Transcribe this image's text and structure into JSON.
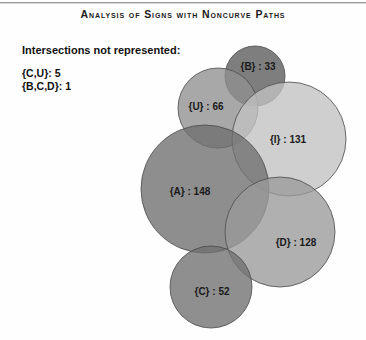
{
  "title": "Analysis of Signs with Noncurve Paths",
  "legend": {
    "heading": "Intersections not represented:",
    "rows": [
      "{C,U}: 5",
      "{B,C,D}: 1"
    ]
  },
  "chart_data": {
    "type": "venn",
    "title": "Analysis of Signs with Noncurve Paths",
    "xlabel": "",
    "ylabel": "",
    "legend_position": "top-left",
    "grid": false,
    "sets": [
      {
        "name": "B",
        "label": "{B} : 33",
        "value": 33,
        "cx": 255,
        "cy": 76,
        "r": 30,
        "color": "#5a5a5a"
      },
      {
        "name": "U",
        "label": "{U} : 66",
        "value": 66,
        "cx": 218,
        "cy": 108,
        "r": 40,
        "color": "#909090"
      },
      {
        "name": "I",
        "label": "{I} : 131",
        "value": 131,
        "cx": 289,
        "cy": 139,
        "r": 57,
        "color": "#c2c2c2"
      },
      {
        "name": "A",
        "label": "{A} : 148",
        "value": 148,
        "cx": 205,
        "cy": 189,
        "r": 64,
        "color": "#6e6e6e"
      },
      {
        "name": "D",
        "label": "{D} : 128",
        "value": 128,
        "cx": 280,
        "cy": 232,
        "r": 55,
        "color": "#9a9a9a"
      },
      {
        "name": "C",
        "label": "{C} : 52",
        "value": 52,
        "cx": 211,
        "cy": 287,
        "r": 41,
        "color": "#6f6f6f"
      }
    ],
    "label_positions": [
      {
        "name": "B",
        "x": 258,
        "y": 66
      },
      {
        "name": "U",
        "x": 206,
        "y": 106
      },
      {
        "name": "I",
        "x": 288,
        "y": 139
      },
      {
        "name": "A",
        "x": 190,
        "y": 191
      },
      {
        "name": "D",
        "x": 296,
        "y": 242
      },
      {
        "name": "C",
        "x": 212,
        "y": 291
      }
    ],
    "unrepresented_intersections": [
      {
        "sets": "{C,U}",
        "value": 5
      },
      {
        "sets": "{B,C,D}",
        "value": 1
      }
    ]
  }
}
